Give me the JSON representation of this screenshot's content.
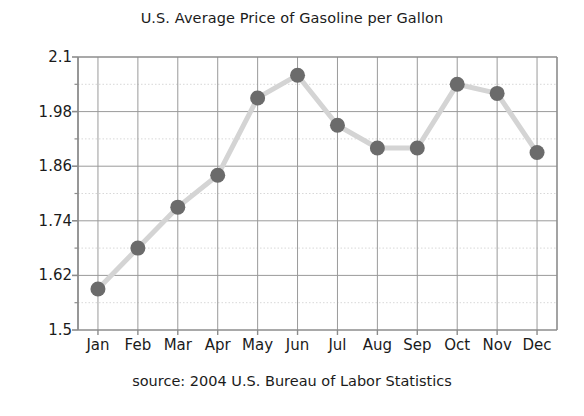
{
  "chart_data": {
    "type": "line",
    "title": "U.S. Average Price of Gasoline per Gallon",
    "caption": "source: 2004 U.S. Bureau of Labor Statistics",
    "xlabel": "",
    "ylabel": "",
    "categories": [
      "Jan",
      "Feb",
      "Mar",
      "Apr",
      "May",
      "Jun",
      "Jul",
      "Aug",
      "Sep",
      "Oct",
      "Nov",
      "Dec"
    ],
    "values": [
      1.59,
      1.68,
      1.77,
      1.84,
      2.01,
      2.06,
      1.95,
      1.9,
      1.9,
      2.04,
      2.02,
      1.89
    ],
    "ylim": [
      1.5,
      2.1
    ],
    "ytick_labels": [
      "1.5",
      "1.62",
      "1.74",
      "1.86",
      "1.98",
      "2.1"
    ],
    "ytick_values": [
      1.5,
      1.62,
      1.74,
      1.86,
      1.98,
      2.1
    ],
    "minor_ytick_values": [
      1.56,
      1.68,
      1.8,
      1.92,
      2.04
    ],
    "grid": true,
    "legend": "none",
    "marker_color": "#6b6b6b",
    "line_color": "#d4d4d4",
    "grid_color": "#9a9a9a",
    "minor_grid_color": "#d8d8d8",
    "axis_color": "#8c8c8c",
    "text_color": "#1b1b1b"
  }
}
